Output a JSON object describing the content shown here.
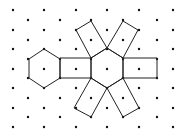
{
  "diagram": {
    "colors": {
      "dot": "#111111",
      "line": "#222222",
      "background": "#ffffff"
    },
    "grid": {
      "even_columns_x": [
        13,
        44,
        76,
        107,
        139,
        173
      ],
      "even_rows_y": [
        10,
        30,
        49,
        69,
        88,
        108,
        127
      ],
      "odd_columns_x": [
        28,
        60,
        91,
        123,
        157
      ],
      "odd_rows_y": [
        20,
        40,
        59,
        78,
        98,
        117
      ]
    },
    "shapes": [
      {
        "name": "left-hexagon",
        "points": [
          [
            44,
            49
          ],
          [
            60,
            59
          ],
          [
            60,
            78
          ],
          [
            44,
            88
          ],
          [
            29,
            78
          ],
          [
            29,
            59
          ]
        ]
      },
      {
        "name": "center-hexagon",
        "points": [
          [
            107,
            48
          ],
          [
            123,
            58
          ],
          [
            123,
            78
          ],
          [
            107,
            88
          ],
          [
            91,
            78
          ],
          [
            91,
            58
          ]
        ]
      },
      {
        "name": "left-square",
        "points": [
          [
            60,
            58
          ],
          [
            91,
            58
          ],
          [
            91,
            78
          ],
          [
            60,
            78
          ]
        ]
      },
      {
        "name": "right-square",
        "points": [
          [
            123,
            58
          ],
          [
            157,
            58
          ],
          [
            157,
            78
          ],
          [
            123,
            78
          ]
        ]
      },
      {
        "name": "top-left-square",
        "points": [
          [
            76,
            30
          ],
          [
            91,
            21
          ],
          [
            107,
            48
          ],
          [
            91,
            58
          ]
        ]
      },
      {
        "name": "top-right-square",
        "points": [
          [
            107,
            48
          ],
          [
            123,
            21
          ],
          [
            138,
            30
          ],
          [
            123,
            58
          ]
        ]
      },
      {
        "name": "bottom-left-square",
        "points": [
          [
            91,
            78
          ],
          [
            107,
            88
          ],
          [
            91,
            117
          ],
          [
            74,
            108
          ]
        ]
      },
      {
        "name": "bottom-right-square",
        "points": [
          [
            107,
            88
          ],
          [
            123,
            78
          ],
          [
            139,
            108
          ],
          [
            123,
            117
          ]
        ]
      }
    ]
  }
}
